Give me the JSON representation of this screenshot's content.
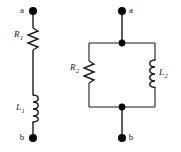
{
  "figure": {
    "type": "electrical-circuit-diagram",
    "background_color": "#ffffff",
    "wire_color": "#1a1a1a",
    "node_color": "#000000",
    "label_color": "#1a1a1a"
  },
  "circuits": [
    {
      "id": "series-circuit",
      "topology": "series",
      "terminals": [
        {
          "name": "terminal-a",
          "label": "a",
          "label_side": "left"
        },
        {
          "name": "terminal-b",
          "label": "b",
          "label_side": "left"
        }
      ],
      "components": [
        {
          "name": "resistor-r1",
          "kind": "resistor",
          "symbol": "zigzag",
          "label": "R",
          "subscript": "1",
          "label_side": "left",
          "orientation": "vertical"
        },
        {
          "name": "inductor-l1",
          "kind": "inductor",
          "symbol": "coil",
          "label": "L",
          "subscript": "1",
          "label_side": "left",
          "orientation": "vertical"
        }
      ]
    },
    {
      "id": "parallel-circuit",
      "topology": "parallel",
      "terminals": [
        {
          "name": "terminal-a",
          "label": "a",
          "label_side": "right"
        },
        {
          "name": "terminal-b",
          "label": "b",
          "label_side": "right"
        }
      ],
      "junctions": [
        {
          "name": "junction-top"
        },
        {
          "name": "junction-bottom"
        }
      ],
      "components": [
        {
          "name": "resistor-r2",
          "kind": "resistor",
          "symbol": "zigzag",
          "label": "R",
          "subscript": "2",
          "label_side": "left",
          "orientation": "vertical",
          "branch": "left"
        },
        {
          "name": "inductor-l2",
          "kind": "inductor",
          "symbol": "coil",
          "label": "L",
          "subscript": "2",
          "label_side": "right",
          "orientation": "vertical",
          "branch": "right"
        }
      ]
    }
  ]
}
